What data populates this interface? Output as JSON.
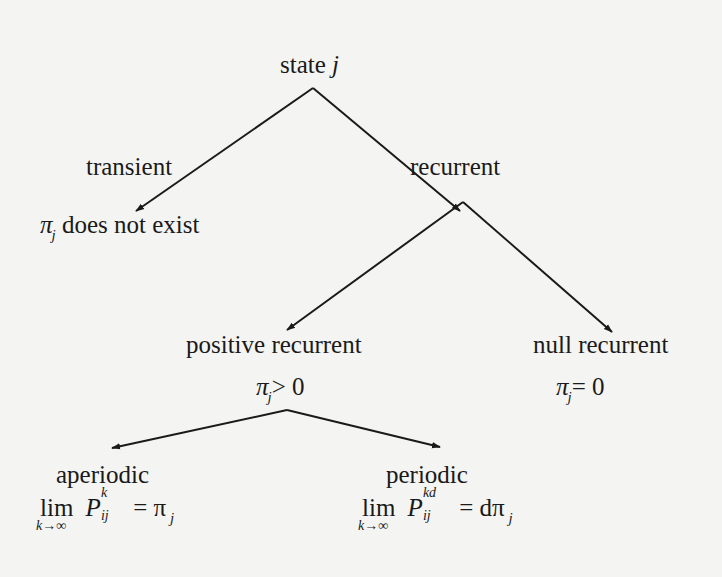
{
  "diagram": {
    "root": {
      "label": "state",
      "var": "j"
    },
    "transient": {
      "label": "transient",
      "pi": "π",
      "pi_sub": "j",
      "condition": "does not exist"
    },
    "recurrent": {
      "label": "recurrent"
    },
    "positive_recurrent": {
      "label": "positive recurrent",
      "pi": "π",
      "pi_sub": "j",
      "condition": "> 0"
    },
    "null_recurrent": {
      "label": "null recurrent",
      "pi": "π",
      "pi_sub": "j",
      "condition": "= 0"
    },
    "aperiodic": {
      "label": "aperiodic",
      "lim": "lim",
      "lim_under": "k→∞",
      "P": "P",
      "P_sup": "k",
      "P_sub": "ij",
      "rhs": "= π",
      "rhs_sub": "j"
    },
    "periodic": {
      "label": "periodic",
      "lim": "lim",
      "lim_under": "k→∞",
      "P": "P",
      "P_sup": "kd",
      "P_sub": "ij",
      "rhs": "= dπ",
      "rhs_sub": "j"
    },
    "edges": [
      {
        "from": "state j",
        "to": "transient"
      },
      {
        "from": "state j",
        "to": "recurrent"
      },
      {
        "from": "recurrent",
        "to": "positive recurrent"
      },
      {
        "from": "recurrent",
        "to": "null recurrent"
      },
      {
        "from": "positive recurrent",
        "to": "aperiodic"
      },
      {
        "from": "positive recurrent",
        "to": "periodic"
      }
    ],
    "colors": {
      "ink": "#1a1a1a",
      "background": "#f4f4f2"
    }
  }
}
